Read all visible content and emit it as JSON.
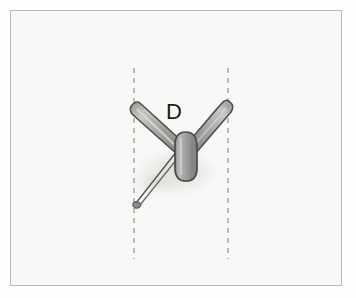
{
  "figure": {
    "background_color": "#f8f8f7",
    "page_color": "#fdfdfc",
    "frame": {
      "border_color": "#b8b8b6",
      "x": 10,
      "y": 10,
      "width": 332,
      "height": 276
    },
    "labels": [
      {
        "id": "D",
        "text": "D",
        "x": 166,
        "y": 101,
        "color": "#1b1b1b",
        "font_size": 22
      }
    ],
    "guide_lines": [
      {
        "name": "left-dashed-guide",
        "orientation": "vertical",
        "x": 134,
        "y_start": 68,
        "y_end": 259,
        "style": "dashed",
        "color": "#9a9a98"
      },
      {
        "name": "right-dashed-guide",
        "orientation": "vertical",
        "x": 228,
        "y_start": 68,
        "y_end": 259,
        "style": "dashed",
        "color": "#9a9a98"
      }
    ],
    "specimen": {
      "name": "winged-specimen",
      "description": "Two elongated grey blade-like wings meeting at a central vertical capsule body, with a thin needle pin extending down to the left",
      "fill_color": "#9f9f9d",
      "outline_color": "#4a4a48",
      "highlight_color": "#cfcfcd",
      "shadow_color": "#e2e2df",
      "parts": [
        {
          "name": "left-wing",
          "tip_x": 131,
          "tip_y": 103,
          "base_x": 180,
          "base_y": 152
        },
        {
          "name": "right-wing",
          "tip_x": 231,
          "tip_y": 101,
          "base_x": 190,
          "base_y": 152
        },
        {
          "name": "central-body",
          "x": 185,
          "y_top": 134,
          "y_bottom": 180
        },
        {
          "name": "pin-needle",
          "from_x": 176,
          "from_y": 152,
          "to_x": 135,
          "to_y": 204
        }
      ]
    }
  }
}
